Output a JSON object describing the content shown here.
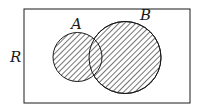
{
  "diagram": {
    "type": "venn",
    "universe_label": "R",
    "sets": [
      {
        "label": "A",
        "shaded": true
      },
      {
        "label": "B",
        "shaded": true
      }
    ],
    "shaded_region": "A ∪ B",
    "colors": {
      "stroke": "#1a1a1a",
      "hatch": "#3a3a3a",
      "background": "#ffffff"
    }
  }
}
